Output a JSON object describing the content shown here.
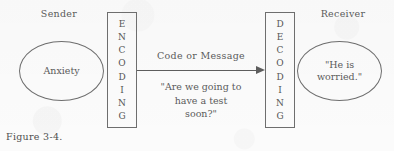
{
  "figure": {
    "caption": "Figure 3-4.",
    "sender_label": "Sender",
    "receiver_label": "Receiver",
    "sender_bubble_text": "Anxiety",
    "receiver_bubble_line1": "\"He is",
    "receiver_bubble_line2": "worried.\"",
    "channel_label": "Code or Message",
    "message_line1": "\"Are we going to",
    "message_line2": "have a test",
    "message_line3": "soon?\"",
    "encoding_letters": [
      "E",
      "N",
      "C",
      "O",
      "D",
      "I",
      "N",
      "G"
    ],
    "decoding_letters": [
      "D",
      "E",
      "C",
      "O",
      "D",
      "I",
      "N",
      "G"
    ],
    "arrow_direction": "left-to-right",
    "colors": {
      "background": "#fbfbfb",
      "stroke": "#6e6e6e",
      "text": "#5a5a5a",
      "arrow": "#5d5d5d"
    }
  }
}
